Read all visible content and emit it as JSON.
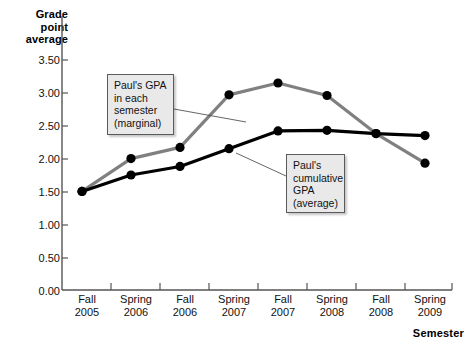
{
  "chart_data": {
    "type": "line",
    "title": "",
    "xlabel": "Semester",
    "ylabel": "Grade point average",
    "categories": [
      "Fall 2005",
      "Spring 2006",
      "Fall 2006",
      "Spring 2007",
      "Fall 2007",
      "Spring 2008",
      "Fall 2008",
      "Spring 2009"
    ],
    "x_tick_lines": [
      {
        "term": "Fall",
        "year": "2005"
      },
      {
        "term": "Spring",
        "year": "2006"
      },
      {
        "term": "Fall",
        "year": "2006"
      },
      {
        "term": "Spring",
        "year": "2007"
      },
      {
        "term": "Fall",
        "year": "2007"
      },
      {
        "term": "Spring",
        "year": "2008"
      },
      {
        "term": "Fall",
        "year": "2008"
      },
      {
        "term": "Spring",
        "year": "2009"
      }
    ],
    "y_tick_labels": [
      "0.00",
      "0.50",
      "1.00",
      "1.50",
      "2.00",
      "2.50",
      "3.00",
      "3.50"
    ],
    "y_tick_values": [
      0.0,
      0.5,
      1.0,
      1.5,
      2.0,
      2.5,
      3.0,
      3.5
    ],
    "ylim": [
      0.0,
      3.5
    ],
    "grid": false,
    "legend_position": "none",
    "series": [
      {
        "name": "Paul's GPA in each semester (marginal)",
        "color": "#808080",
        "marker_color": "#000000",
        "values": [
          1.5,
          2.0,
          2.17,
          2.97,
          3.15,
          2.96,
          2.38,
          1.93
        ]
      },
      {
        "name": "Paul's cumulative GPA (average)",
        "color": "#000000",
        "marker_color": "#000000",
        "values": [
          1.5,
          1.75,
          1.88,
          2.15,
          2.42,
          2.43,
          2.38,
          2.35
        ]
      }
    ],
    "annotations": [
      {
        "id": "marginal",
        "lines": [
          "Paul's GPA",
          "in each",
          "semester",
          "(marginal)"
        ],
        "target_series": "Paul's GPA in each semester (marginal)"
      },
      {
        "id": "cumulative",
        "lines": [
          "Paul's",
          "cumulative",
          "GPA",
          "(average)"
        ],
        "target_series": "Paul's cumulative GPA (average)"
      }
    ]
  },
  "axis": {
    "y_title_lines": [
      "Grade",
      "point",
      "average"
    ],
    "x_title": "Semester"
  }
}
